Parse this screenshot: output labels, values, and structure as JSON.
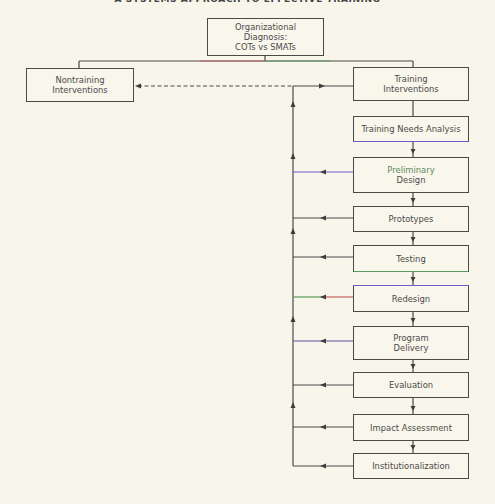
{
  "title": "A SYSTEMS APPROACH TO EFFECTIVE TRAINING",
  "diagram": {
    "root": {
      "lines": [
        "Organizational",
        "Diagnosis:",
        "COTs vs SMATs"
      ]
    },
    "nontraining": {
      "lines": [
        "Nontraining",
        "Interventions"
      ]
    },
    "training": {
      "lines": [
        "Training",
        "Interventions"
      ]
    },
    "stages": [
      {
        "id": "tna",
        "lines": [
          "Training Needs Analysis"
        ]
      },
      {
        "id": "preliminary-design",
        "lines": [
          "Preliminary",
          "Design"
        ]
      },
      {
        "id": "prototypes",
        "lines": [
          "Prototypes"
        ]
      },
      {
        "id": "testing",
        "lines": [
          "Testing"
        ]
      },
      {
        "id": "redesign",
        "lines": [
          "Redesign"
        ]
      },
      {
        "id": "program-delivery",
        "lines": [
          "Program",
          "Delivery"
        ]
      },
      {
        "id": "evaluation",
        "lines": [
          "Evaluation"
        ]
      },
      {
        "id": "impact-assessment",
        "lines": [
          "Impact Assessment"
        ]
      },
      {
        "id": "institutionalization",
        "lines": [
          "Institutionalization"
        ]
      }
    ],
    "edges": [
      {
        "from": "root",
        "to": "nontraining",
        "style": "solid"
      },
      {
        "from": "root",
        "to": "training",
        "style": "solid"
      },
      {
        "from": "feedback-loop",
        "to": "nontraining",
        "style": "dashed"
      },
      {
        "from": "feedback-loop",
        "to": "training",
        "style": "solid"
      },
      {
        "from": "training",
        "to": "tna",
        "style": "solid"
      },
      {
        "from": "tna",
        "to": "preliminary-design",
        "style": "solid"
      },
      {
        "from": "preliminary-design",
        "to": "prototypes",
        "style": "solid"
      },
      {
        "from": "prototypes",
        "to": "testing",
        "style": "solid"
      },
      {
        "from": "testing",
        "to": "redesign",
        "style": "solid"
      },
      {
        "from": "redesign",
        "to": "program-delivery",
        "style": "solid"
      },
      {
        "from": "program-delivery",
        "to": "evaluation",
        "style": "solid"
      },
      {
        "from": "evaluation",
        "to": "impact-assessment",
        "style": "solid"
      },
      {
        "from": "impact-assessment",
        "to": "institutionalization",
        "style": "solid"
      },
      {
        "from": "preliminary-design",
        "to": "feedback-loop",
        "style": "solid"
      },
      {
        "from": "prototypes",
        "to": "feedback-loop",
        "style": "solid"
      },
      {
        "from": "testing",
        "to": "feedback-loop",
        "style": "solid"
      },
      {
        "from": "redesign",
        "to": "feedback-loop",
        "style": "solid"
      },
      {
        "from": "program-delivery",
        "to": "feedback-loop",
        "style": "solid"
      },
      {
        "from": "evaluation",
        "to": "feedback-loop",
        "style": "solid"
      },
      {
        "from": "impact-assessment",
        "to": "feedback-loop",
        "style": "solid"
      },
      {
        "from": "institutionalization",
        "to": "feedback-loop",
        "style": "solid"
      }
    ]
  },
  "colors": {
    "background": "#f8f5ea",
    "line": "#4a4a48",
    "accent_purple": "#6a5fc8",
    "accent_red": "#c9605e",
    "accent_green": "#5b9a5a"
  }
}
